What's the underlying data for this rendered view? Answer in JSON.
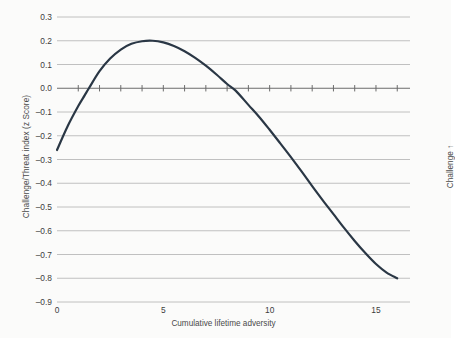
{
  "chart_data": {
    "type": "line",
    "title": "",
    "xlabel": "Cumulative lifetime adversity",
    "ylabel": "Challenge/Threat index (z Score)",
    "ylabel_right": "Challenge ↑",
    "xlim": [
      0,
      16.6
    ],
    "ylim": [
      -0.9,
      0.3
    ],
    "grid": true,
    "legend": null,
    "x_ticklabels": [
      "0",
      "5",
      "10",
      "15"
    ],
    "x_tickvalues": [
      0,
      5,
      10,
      15
    ],
    "y_ticklabels": [
      "0.3",
      "0.2",
      "0.1",
      "0.0",
      "–0.1",
      "–0.2",
      "–0.3",
      "–0.4",
      "–0.5",
      "–0.6",
      "–0.7",
      "–0.8",
      "–0.9"
    ],
    "y_tickvalues": [
      0.3,
      0.2,
      0.1,
      0.0,
      -0.1,
      -0.2,
      -0.3,
      -0.4,
      -0.5,
      -0.6,
      -0.7,
      -0.8,
      -0.9
    ],
    "zero_line_ticks_x": [
      1,
      2,
      3,
      4,
      5,
      6,
      7,
      8,
      9,
      10,
      11,
      12,
      13,
      14,
      15,
      16
    ],
    "series": [
      {
        "name": "Challenge/Threat index",
        "color": "#2a3745",
        "linewidth": 2.2,
        "x": [
          0.0,
          0.5,
          1.0,
          1.3,
          1.5,
          2.0,
          2.5,
          3.0,
          3.5,
          4.0,
          4.5,
          5.0,
          5.5,
          6.0,
          6.5,
          7.0,
          7.5,
          8.0,
          8.4,
          9.0,
          9.5,
          10.0,
          10.5,
          11.0,
          11.5,
          12.0,
          12.5,
          13.0,
          13.5,
          14.0,
          14.5,
          15.0,
          15.5,
          16.0
        ],
        "y": [
          -0.26,
          -0.16,
          -0.075,
          -0.03,
          0.0,
          0.072,
          0.125,
          0.163,
          0.187,
          0.198,
          0.2,
          0.193,
          0.178,
          0.156,
          0.128,
          0.095,
          0.058,
          0.018,
          -0.01,
          -0.07,
          -0.12,
          -0.175,
          -0.232,
          -0.29,
          -0.35,
          -0.412,
          -0.472,
          -0.53,
          -0.588,
          -0.643,
          -0.694,
          -0.74,
          -0.776,
          -0.8
        ]
      }
    ],
    "annotations": []
  },
  "style": {
    "background": "#fbfbfa",
    "gridline_color": "#b9b9b9",
    "zeroline_color": "#6b6b6b",
    "tick_text_color": "#3d3d3d",
    "axis_title_color": "#4a4a4a"
  }
}
